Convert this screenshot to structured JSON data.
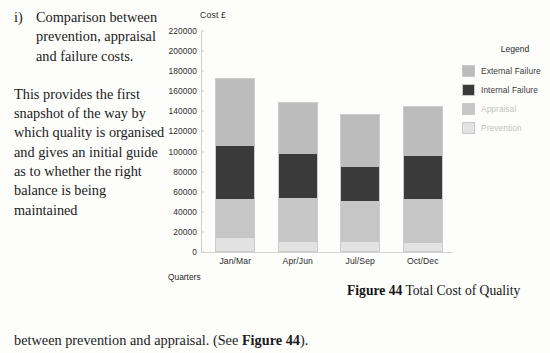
{
  "document": {
    "list_marker": "i)",
    "paragraph_1": "Comparison between prevention, appraisal and failure costs.",
    "paragraph_2": "This provides the first snapshot of the way by which quality is organised and gives an initial guide as to whether the right balance is being maintained",
    "tail_prefix": "between prevention and appraisal.  (See ",
    "tail_bold": "Figure 44",
    "tail_suffix": ")."
  },
  "figure": {
    "caption_label": "Figure 44",
    "caption_text": " Total Cost of Quality"
  },
  "legend": {
    "title": "Legend",
    "items": [
      {
        "label": "External Failure",
        "color": "#bcbcbc"
      },
      {
        "label": "Internal Failure",
        "color": "#3a3a3a"
      },
      {
        "label": "Appraisal",
        "color": "#c6c6c6"
      },
      {
        "label": "Prevention",
        "color": "#e2e2e2"
      }
    ]
  },
  "chart_data": {
    "type": "bar",
    "subtype": "stacked",
    "title": "Total Cost of Quality",
    "xlabel": "Quarters",
    "ylabel": "Cost £",
    "ylim": [
      0,
      220000
    ],
    "ytick_step": 20000,
    "yticks": [
      "220000",
      "200000",
      "180000",
      "160000",
      "140000",
      "120000",
      "100000",
      "80000",
      "60000",
      "40000",
      "20000",
      "0"
    ],
    "ytick_values": [
      220000,
      200000,
      180000,
      160000,
      140000,
      120000,
      100000,
      80000,
      60000,
      40000,
      20000,
      0
    ],
    "grid": false,
    "legend_position": "right",
    "categories": [
      "Jan/Mar",
      "Apr/Jun",
      "Jul/Sep",
      "Oct/Dec"
    ],
    "series": [
      {
        "name": "Prevention",
        "color": "#e2e2e2",
        "values": [
          14000,
          10000,
          10000,
          9000
        ]
      },
      {
        "name": "Appraisal",
        "color": "#c6c6c6",
        "values": [
          39000,
          44000,
          41000,
          44000
        ]
      },
      {
        "name": "Internal Failure",
        "color": "#3a3a3a",
        "values": [
          53000,
          44000,
          34000,
          43000
        ]
      },
      {
        "name": "External Failure",
        "color": "#bcbcbc",
        "values": [
          67000,
          51000,
          52000,
          49000
        ]
      }
    ],
    "totals": [
      173000,
      149000,
      137000,
      145000
    ],
    "bars": [
      {
        "category": "Jan/Mar",
        "prevention": 14000,
        "appraisal": 39000,
        "internal_failure": 53000,
        "external_failure": 67000,
        "total": 173000
      },
      {
        "category": "Apr/Jun",
        "prevention": 10000,
        "appraisal": 44000,
        "internal_failure": 44000,
        "external_failure": 51000,
        "total": 149000
      },
      {
        "category": "Jul/Sep",
        "prevention": 10000,
        "appraisal": 41000,
        "internal_failure": 34000,
        "external_failure": 52000,
        "total": 137000
      },
      {
        "category": "Oct/Dec",
        "prevention": 9000,
        "appraisal": 44000,
        "internal_failure": 43000,
        "external_failure": 49000,
        "total": 145000
      }
    ]
  }
}
